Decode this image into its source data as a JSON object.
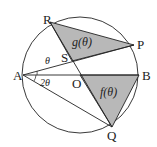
{
  "diagram": {
    "points": {
      "A": {
        "label": "A",
        "x": 23,
        "y": 75
      },
      "B": {
        "label": "B",
        "x": 139,
        "y": 75
      },
      "O": {
        "label": "O",
        "x": 80,
        "y": 75
      },
      "R": {
        "label": "R",
        "x": 50,
        "y": 22
      },
      "P": {
        "label": "P",
        "x": 134,
        "y": 45
      },
      "Q": {
        "label": "Q",
        "x": 112,
        "y": 127
      },
      "S": {
        "label": "S",
        "x": 72,
        "y": 61
      }
    },
    "circle": {
      "cx": 80,
      "cy": 75,
      "r": 58
    },
    "regions": {
      "g": {
        "label": "g(θ)",
        "fill": "#b8b8b8"
      },
      "f": {
        "label": "f(θ)",
        "fill": "#b8b8b8"
      }
    },
    "angles": {
      "theta": "θ",
      "two_theta": "2θ"
    },
    "stroke_color": "#222222"
  }
}
